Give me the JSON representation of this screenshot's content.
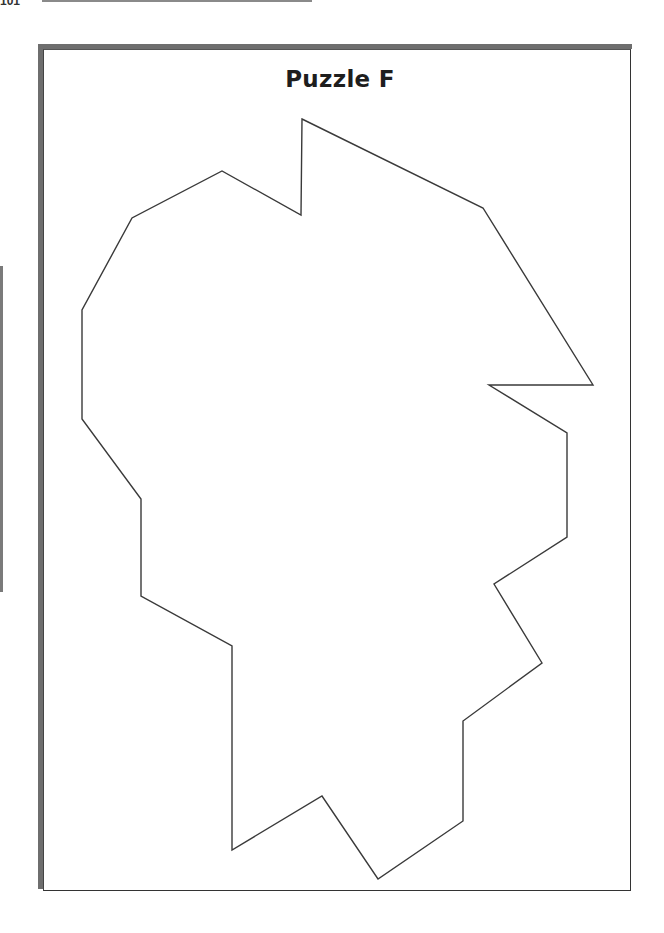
{
  "page": {
    "page_number_fragment": "101",
    "title": "Puzzle F"
  },
  "colors": {
    "frame_shadow": "#6e6e6e",
    "frame_border": "#333333",
    "outline_stroke": "#3a3a3a",
    "background": "#ffffff"
  },
  "shape": {
    "name": "puzzle-outline",
    "points": "302,119 483,208 593,385 489,385 567,433 567,537 494,584 542,663 463,721 463,821 378,879 322,796 232,850 232,646 141,596 141,499 82,419 82,310 132,218 222,171 301,215"
  }
}
